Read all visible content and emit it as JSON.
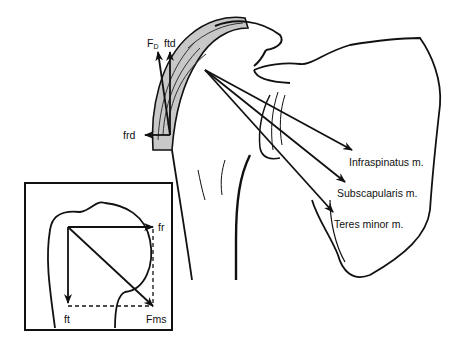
{
  "figure": {
    "colors": {
      "line": "#111111",
      "shade": "#c8c8c8",
      "background": "#ffffff"
    },
    "main_labels": {
      "fd_main": "F",
      "fd_sub": "D",
      "ftd": "ftd",
      "frd": "frd",
      "infraspinatus": "Infraspinatus m.",
      "subscapularis": "Subscapularis m.",
      "teres_minor": "Teres minor m."
    },
    "inset_labels": {
      "fr": "fr",
      "ft": "ft",
      "fms": "Fms"
    }
  }
}
